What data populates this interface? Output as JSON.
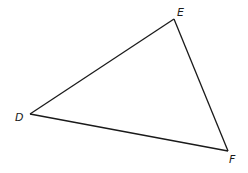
{
  "diagram": {
    "type": "triangle",
    "vertices": [
      {
        "id": "D",
        "label": "D",
        "x": 30,
        "y": 114
      },
      {
        "id": "E",
        "label": "E",
        "x": 174,
        "y": 19
      },
      {
        "id": "F",
        "label": "F",
        "x": 228,
        "y": 151
      }
    ],
    "sides": [
      {
        "id": "DE",
        "from": "D",
        "to": "E"
      },
      {
        "id": "EF",
        "from": "E",
        "to": "F"
      },
      {
        "id": "FD",
        "from": "F",
        "to": "D"
      }
    ],
    "line_color": "#1a1a1a",
    "background": "#ffffff"
  }
}
